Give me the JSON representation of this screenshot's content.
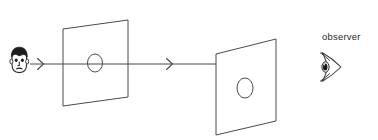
{
  "diagram": {
    "background_color": "#ffffff",
    "stroke_color": "#3a3a3a",
    "text_color": "#2b2b2b",
    "labels": {
      "observer": "observer"
    },
    "icons": {
      "source_head": "head-icon",
      "eye": "eye-icon",
      "arrow_1": "arrowhead-right-icon",
      "arrow_2": "arrowhead-right-icon"
    },
    "elements": {
      "head": {
        "name": "source-head",
        "center_x": 19,
        "center_y": 61
      },
      "ray_line": {
        "name": "light-ray",
        "y": 64,
        "x_start": 30,
        "x_end": 216
      },
      "arrowhead_1": {
        "name": "arrowhead-1",
        "x": 41,
        "y": 64
      },
      "arrowhead_2": {
        "name": "arrowhead-2",
        "x": 170,
        "y": 64
      },
      "plane_1": {
        "name": "aperture-plane",
        "points": "63,29 128,20 128,97 63,106",
        "hole_cx": 95,
        "hole_cy": 63,
        "hole_rx": 7.5,
        "hole_ry": 9
      },
      "plane_2": {
        "name": "screen-plane",
        "points": "216,54 276,39 276,121 216,135",
        "hole_cx": 245,
        "hole_cy": 88,
        "hole_rx": 8,
        "hole_ry": 10
      },
      "eye": {
        "name": "observer-eye",
        "center_x": 330,
        "center_y": 67
      }
    }
  }
}
